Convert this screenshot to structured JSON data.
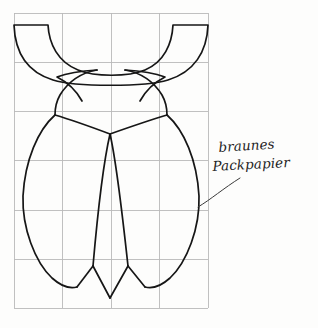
{
  "document": {
    "kind": "craft-pattern-sheet",
    "title": "Beetle cut-out pattern on grid",
    "background_color": "#fdfdfc"
  },
  "grid": {
    "name": "scaling-grid",
    "columns": 4,
    "rows": 6,
    "cell_size_px": 48.5,
    "left_px": 14,
    "top_px": 13,
    "right_px": 208,
    "bottom_px": 308,
    "line_color": "#b9b9b9",
    "line_width_px": 0.9,
    "vertical_lines_x": [
      14,
      62.5,
      111,
      159.5,
      208
    ],
    "horizontal_lines_y": [
      13,
      62,
      111,
      160,
      210,
      259,
      308
    ]
  },
  "pattern": {
    "name": "beetle-template",
    "stroke_color": "#161616",
    "stroke_width_px": 1.7,
    "fill": "none",
    "parts": [
      {
        "name": "head-crescent",
        "label": "head"
      },
      {
        "name": "pronotum-shape",
        "label": "pronotum"
      },
      {
        "name": "left-elytron",
        "label": "left wing case"
      },
      {
        "name": "right-elytron",
        "label": "right wing case"
      }
    ]
  },
  "annotation": {
    "name": "material-note",
    "line1": "braunes",
    "line2": "Packpapier",
    "full_text": "braunes Packpapier",
    "text_color": "#232323",
    "leader": {
      "name": "leader-line",
      "from_x": 198,
      "from_y": 207,
      "to_x": 238,
      "to_y": 178,
      "stroke_color": "#3a3a3a",
      "stroke_width_px": 1.0
    }
  }
}
